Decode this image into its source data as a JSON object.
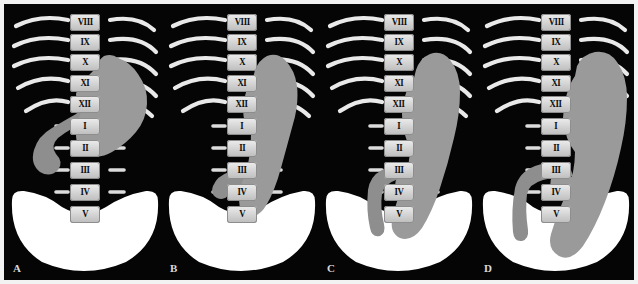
{
  "figure": {
    "type": "medical-illustration",
    "panel_count": 4,
    "background_color": "#050505",
    "border_color": "#f2f2f2"
  },
  "legend": {
    "stomach_color": "#9a9a9a",
    "duodenum_color": "#8e8e8e",
    "bone_color": "#e9e9e9",
    "vertebra_body_color": "#d8d8d8",
    "vertebra_label_color": "#0b0b0b",
    "pelvis_color": "#ffffff"
  },
  "vertebrae": {
    "labels": [
      "VIII",
      "IX",
      "X",
      "XI",
      "XII",
      "I",
      "II",
      "III",
      "IV",
      "V"
    ],
    "thoracic": [
      "VIII",
      "IX",
      "X",
      "XI",
      "XII"
    ],
    "lumbar": [
      "I",
      "II",
      "III",
      "IV",
      "V"
    ],
    "count": 10,
    "rib_bearing_count": 5
  },
  "panels": [
    {
      "letter": "A",
      "name": "panel-a",
      "stomach_type": "steer-horn",
      "stomach_note": "High transverse stomach, fundus at XI, pylorus above L2, duodenal C-loop prominent to the left of the spine",
      "stomach_lowest_vertebra": "III",
      "duodenum_visible": true
    },
    {
      "letter": "B",
      "name": "panel-b",
      "stomach_type": "J-shaped",
      "stomach_note": "Moderately elongated stomach descending to the level of L4, body vertical along the right of the spine",
      "stomach_lowest_vertebra": "IV",
      "duodenum_visible": true
    },
    {
      "letter": "C",
      "name": "panel-c",
      "stomach_type": "elongated-J",
      "stomach_note": "Long J stomach reaching into the pelvic brim, greater curvature below L5",
      "stomach_lowest_vertebra": "V",
      "duodenum_visible": true
    },
    {
      "letter": "D",
      "name": "panel-d",
      "stomach_type": "cascade-hypotonic",
      "stomach_note": "Markedly ptotic hypotonic stomach, greater curvature descending well into the pelvis",
      "stomach_lowest_vertebra": "V",
      "duodenum_visible": true
    }
  ]
}
